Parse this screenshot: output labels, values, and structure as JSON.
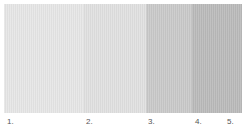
{
  "swatches": [
    {
      "id": "1",
      "color": "#e6e6e6",
      "width": 79
    },
    {
      "id": "2",
      "color": "#e0e0e0",
      "width": 63
    },
    {
      "id": "3",
      "color": "#c9c9c9",
      "width": 46
    },
    {
      "id": "4",
      "color": "#bababa",
      "width": 50
    }
  ],
  "labels": [
    {
      "text": "1.",
      "x": 7
    },
    {
      "text": "2.",
      "x": 86
    },
    {
      "text": "3.",
      "x": 148
    },
    {
      "text": "4.",
      "x": 195
    },
    {
      "text": "5.",
      "x": 227
    }
  ]
}
